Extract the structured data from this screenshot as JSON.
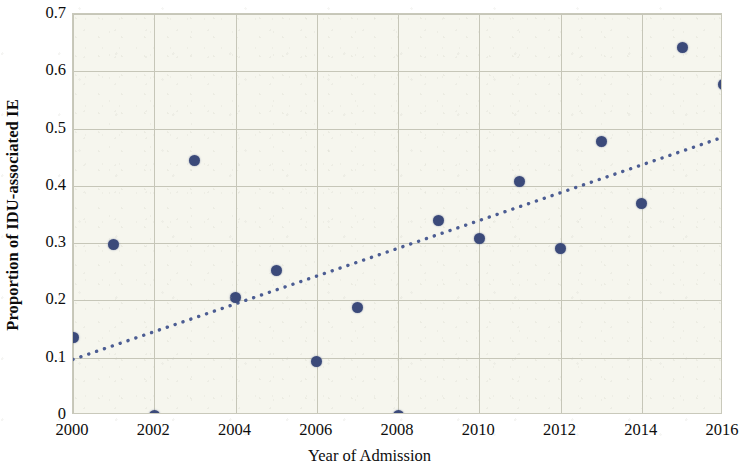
{
  "chart_data": {
    "type": "scatter",
    "title": "",
    "xlabel": "Year of Admission",
    "ylabel": "Proportion of IDU-associated IE",
    "xlim": [
      2000,
      2016
    ],
    "ylim": [
      0,
      0.7
    ],
    "grid": true,
    "legend": "none",
    "xtick_labels": [
      "2000",
      "2002",
      "2004",
      "2006",
      "2008",
      "2010",
      "2012",
      "2014",
      "2016"
    ],
    "xtick_values": [
      2000,
      2002,
      2004,
      2006,
      2008,
      2010,
      2012,
      2014,
      2016
    ],
    "ytick_labels": [
      "0",
      "0.1",
      "0.2",
      "0.3",
      "0.4",
      "0.5",
      "0.6",
      "0.7"
    ],
    "ytick_values": [
      0,
      0.1,
      0.2,
      0.3,
      0.4,
      0.5,
      0.6,
      0.7
    ],
    "x": [
      2000,
      2001,
      2002,
      2003,
      2004,
      2005,
      2006,
      2007,
      2008,
      2009,
      2010,
      2011,
      2012,
      2013,
      2014,
      2015,
      2016
    ],
    "values": [
      0.135,
      0.297,
      0.0,
      0.445,
      0.205,
      0.253,
      0.093,
      0.188,
      0.0,
      0.34,
      0.308,
      0.408,
      0.29,
      0.477,
      0.37,
      0.642,
      0.577
    ],
    "series": [
      {
        "name": "Proportion of IDU-associated IE",
        "marker": "circle",
        "color": "#3b4a7a",
        "points": [
          {
            "x": 2000,
            "y": 0.135
          },
          {
            "x": 2001,
            "y": 0.297
          },
          {
            "x": 2002,
            "y": 0.0
          },
          {
            "x": 2003,
            "y": 0.445
          },
          {
            "x": 2004,
            "y": 0.205
          },
          {
            "x": 2005,
            "y": 0.253
          },
          {
            "x": 2006,
            "y": 0.093
          },
          {
            "x": 2007,
            "y": 0.188
          },
          {
            "x": 2008,
            "y": 0.0
          },
          {
            "x": 2009,
            "y": 0.34
          },
          {
            "x": 2010,
            "y": 0.308
          },
          {
            "x": 2011,
            "y": 0.408
          },
          {
            "x": 2012,
            "y": 0.29
          },
          {
            "x": 2013,
            "y": 0.477
          },
          {
            "x": 2014,
            "y": 0.37
          },
          {
            "x": 2015,
            "y": 0.642
          },
          {
            "x": 2016,
            "y": 0.577
          }
        ]
      }
    ],
    "trendline": {
      "name": "linear trend",
      "style": "dotted",
      "color": "#4c5d93",
      "x_start": 2000,
      "y_start": 0.097,
      "x_end": 2016,
      "y_end": 0.485
    },
    "colors": {
      "marker": "#3b4a7a",
      "trendline": "#4c5d93",
      "plot_background": "#f6f6ee",
      "gridline": "#c6c6b8",
      "axis_text": "#0d0d0d"
    }
  }
}
